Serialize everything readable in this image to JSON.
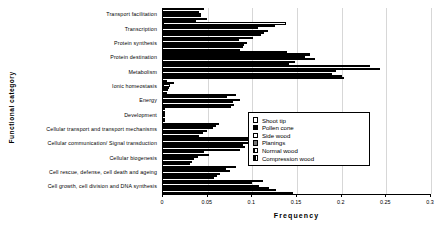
{
  "chart_data": {
    "type": "bar",
    "orientation": "horizontal",
    "title": "",
    "xlabel": "Frequency",
    "ylabel": "Functional category",
    "xlim": [
      0,
      0.3
    ],
    "xticks": [
      "0",
      "0.05",
      "0.1",
      "0.15",
      "0.2",
      "0.25",
      "0.3"
    ],
    "xtick_values": [
      0,
      0.05,
      0.1,
      0.15,
      0.2,
      0.25,
      0.3
    ],
    "grid": true,
    "legend_position": "middle-right",
    "categories": [
      "Transport facilitation",
      "Transcription",
      "Protein synthesis",
      "Protein destination",
      "Metabolism",
      "Ionic homeostasis",
      "Energy",
      "Development",
      "Cellular transport and transport mechanisms",
      "Cellular communication/ Signal transduction",
      "Cellular biogenesis",
      "Cell rescue, defense, cell death and ageing",
      "Cell growth, cell division and DNA synthesis"
    ],
    "series": [
      {
        "name": "Shoot tip",
        "pattern": "open-white",
        "values": [
          0.046,
          0.138,
          0.101,
          0.139,
          0.232,
          0.004,
          0.082,
          0.0,
          0.063,
          0.103,
          0.046,
          0.082,
          0.112
        ]
      },
      {
        "name": "Pollen cone",
        "pattern": "solid-black",
        "values": [
          0.04,
          0.125,
          0.085,
          0.164,
          0.243,
          0.012,
          0.072,
          0.0,
          0.059,
          0.095,
          0.052,
          0.07,
          0.1
        ]
      },
      {
        "name": "Side wood",
        "pattern": "open-white",
        "values": [
          0.043,
          0.106,
          0.094,
          0.159,
          0.194,
          0.008,
          0.086,
          0.0,
          0.056,
          0.098,
          0.039,
          0.075,
          0.108
        ]
      },
      {
        "name": "Planings",
        "pattern": "dark-hatch",
        "values": [
          0.042,
          0.117,
          0.091,
          0.17,
          0.189,
          0.007,
          0.078,
          0.0,
          0.049,
          0.089,
          0.035,
          0.064,
          0.119
        ]
      },
      {
        "name": "Normal wood",
        "pattern": "vertical-stripe",
        "values": [
          0.049,
          0.113,
          0.089,
          0.148,
          0.2,
          0.006,
          0.08,
          0.0,
          0.045,
          0.092,
          0.033,
          0.06,
          0.126
        ]
      },
      {
        "name": "Compression wood",
        "pattern": "crosshatch",
        "values": [
          0.037,
          0.11,
          0.086,
          0.141,
          0.203,
          0.005,
          0.076,
          0.0,
          0.04,
          0.086,
          0.03,
          0.057,
          0.145
        ]
      }
    ]
  },
  "legend": {
    "items": [
      {
        "label": "Shoot tip",
        "swatch": "open-white"
      },
      {
        "label": "Pollen cone",
        "swatch": "solid-black"
      },
      {
        "label": "Side wood",
        "swatch": "open-white"
      },
      {
        "label": "Planings",
        "swatch": "dark-hatch"
      },
      {
        "label": "Normal wood",
        "swatch": "vertical-stripe"
      },
      {
        "label": "Compression wood",
        "swatch": "crosshatch"
      }
    ]
  }
}
